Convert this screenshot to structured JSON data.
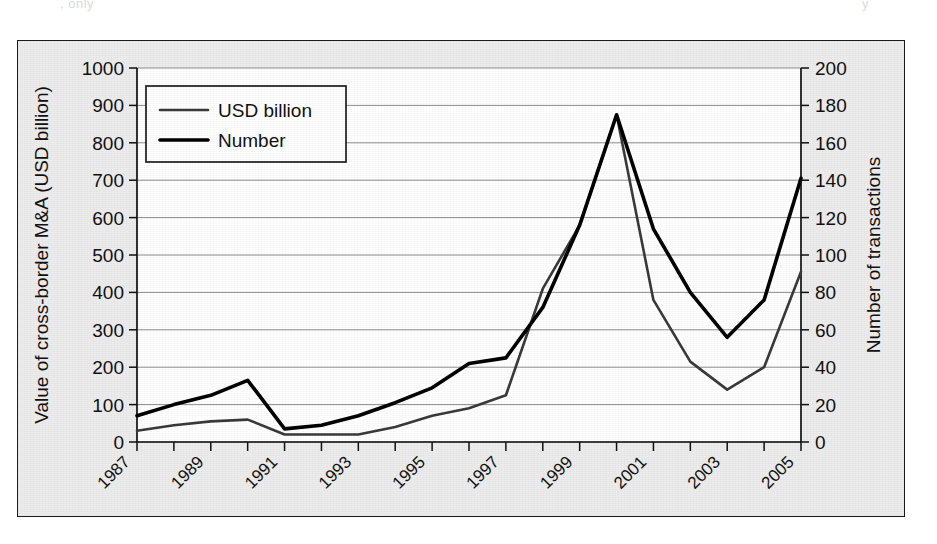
{
  "page": {
    "scan_artifact_top": ", only",
    "scan_artifact_top_right": "y",
    "scan_artifact_bottom": ""
  },
  "chart_data": {
    "type": "line",
    "title": "",
    "xlabel": "",
    "ylabel": "Value of cross-border M&A (USD billion)",
    "y2label": "Number of transactions",
    "x": [
      1987,
      1988,
      1989,
      1990,
      1991,
      1992,
      1993,
      1994,
      1995,
      1996,
      1997,
      1998,
      1999,
      2000,
      2001,
      2002,
      2003,
      2004,
      2005
    ],
    "xtick_labels": [
      "1987",
      "",
      "1989",
      "",
      "1991",
      "",
      "1993",
      "",
      "1995",
      "",
      "1997",
      "",
      "1999",
      "",
      "2001",
      "",
      "2003",
      "",
      "2005"
    ],
    "xtick_labels_shown": [
      "1987",
      "1989",
      "1991",
      "1993",
      "1995",
      "1997",
      "1999",
      "2001",
      "2003",
      "2005"
    ],
    "ylim": [
      0,
      1000
    ],
    "y2lim": [
      0,
      200
    ],
    "yticks": [
      0,
      100,
      200,
      300,
      400,
      500,
      600,
      700,
      800,
      900,
      1000
    ],
    "ytick_labels": [
      "0",
      "100",
      "200",
      "300",
      "400",
      "500",
      "600",
      "700",
      "800",
      "900",
      "1000"
    ],
    "y2ticks": [
      0,
      20,
      40,
      60,
      80,
      100,
      120,
      140,
      160,
      180,
      200
    ],
    "y2tick_labels": [
      "0",
      "20",
      "40",
      "60",
      "80",
      "100",
      "120",
      "140",
      "160",
      "180",
      "200"
    ],
    "grid": true,
    "grid_axis": "y",
    "legend_position": "upper-left-inside",
    "series": [
      {
        "name": "USD billion",
        "axis": "left",
        "color": "#3a3a3a",
        "line_width": 2.6,
        "values": [
          30,
          45,
          55,
          60,
          20,
          20,
          20,
          40,
          70,
          90,
          125,
          410,
          580,
          875,
          380,
          215,
          140,
          200,
          455
        ]
      },
      {
        "name": "Number",
        "axis": "right",
        "color": "#000000",
        "line_width": 3.6,
        "values": [
          14,
          20,
          25,
          33,
          7,
          9,
          14,
          21,
          29,
          42,
          45,
          72,
          116,
          175,
          114,
          80,
          56,
          76,
          141
        ]
      }
    ]
  }
}
